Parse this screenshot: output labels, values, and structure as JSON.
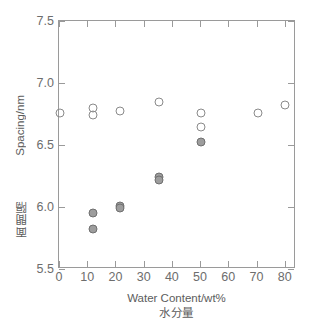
{
  "chart_data": {
    "type": "scatter",
    "title": "",
    "xlabel": "Water Content/wt%",
    "xlabel_jp": "水分量",
    "ylabel": "Spacing/nm",
    "ylabel_jp": "面間隔",
    "xlim": [
      0,
      84
    ],
    "ylim": [
      5.5,
      7.5
    ],
    "xticks": [
      0,
      10,
      20,
      30,
      40,
      50,
      60,
      70,
      80
    ],
    "xtick_labels": [
      "0",
      "10",
      "20",
      "30",
      "40",
      "50",
      "60",
      "70",
      "80"
    ],
    "yticks": [
      5.5,
      6.0,
      6.5,
      7.0,
      7.5
    ],
    "ytick_labels": [
      "5.5",
      "6.0",
      "6.5",
      "7.0",
      "7.5"
    ],
    "grid": false,
    "legend": "none",
    "colors": {
      "open_marker_edge": "#8a8a8a",
      "filled_marker_face": "#9d9d9d",
      "filled_marker_edge": "#6f6f6f",
      "axis": "#9a9a9a",
      "text": "#5c5c5c"
    },
    "series": [
      {
        "name": "open circles",
        "marker": "open-circle",
        "points": [
          {
            "x": 0.3,
            "y": 6.755
          },
          {
            "x": 12.2,
            "y": 6.8
          },
          {
            "x": 12.2,
            "y": 6.745
          },
          {
            "x": 21.5,
            "y": 6.775
          },
          {
            "x": 35.5,
            "y": 6.85
          },
          {
            "x": 50.4,
            "y": 6.755
          },
          {
            "x": 50.4,
            "y": 6.645
          },
          {
            "x": 70.4,
            "y": 6.755
          },
          {
            "x": 80.2,
            "y": 6.825
          }
        ]
      },
      {
        "name": "filled circles",
        "marker": "filled-circle",
        "points": [
          {
            "x": 12.2,
            "y": 5.955
          },
          {
            "x": 12.2,
            "y": 5.825
          },
          {
            "x": 21.5,
            "y": 6.01
          },
          {
            "x": 21.5,
            "y": 5.99
          },
          {
            "x": 35.5,
            "y": 6.245
          },
          {
            "x": 35.5,
            "y": 6.22
          },
          {
            "x": 50.4,
            "y": 6.525
          }
        ]
      }
    ]
  }
}
